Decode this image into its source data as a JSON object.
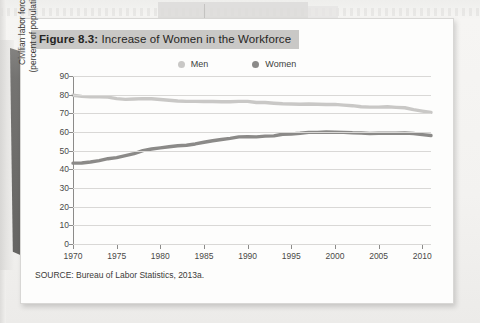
{
  "figure": {
    "number_label": "Figure 8.3:",
    "title": " Increase of Women in the Workforce",
    "source": "SOURCE: Bureau of Labor Statistics, 2013a."
  },
  "colors": {
    "men_line": "#c9c8c6",
    "women_line": "#8b8a88",
    "grid": "#d9d8d6",
    "axis": "#8c8b89",
    "title_band": "#c9c8c6",
    "card": "#fdfdfc",
    "page": "#f2f1ef",
    "binding_shadow": "#6e6d6b"
  },
  "chart_data": {
    "type": "line",
    "title": "Figure 8.3: Increase of Women in the Workforce",
    "xlabel": "",
    "ylabel": "Civilian labor force (percent of population)",
    "ylabel_line1": "Civilian labor force",
    "ylabel_line2": "(percent of population)",
    "xlim": [
      1970,
      2011
    ],
    "ylim": [
      0,
      90
    ],
    "ytick_step": 10,
    "grid": true,
    "legend_position": "top-center",
    "yticks": [
      90,
      80,
      70,
      60,
      50,
      40,
      30,
      20,
      10,
      0
    ],
    "xticks": [
      1970,
      1975,
      1980,
      1985,
      1990,
      1995,
      2000,
      2005,
      2010
    ],
    "x": [
      1970,
      1971,
      1972,
      1973,
      1974,
      1975,
      1976,
      1977,
      1978,
      1979,
      1980,
      1981,
      1982,
      1983,
      1984,
      1985,
      1986,
      1987,
      1988,
      1989,
      1990,
      1991,
      1992,
      1993,
      1994,
      1995,
      1996,
      1997,
      1998,
      1999,
      2000,
      2001,
      2002,
      2003,
      2004,
      2005,
      2006,
      2007,
      2008,
      2009,
      2010,
      2011
    ],
    "series": [
      {
        "name": "Men",
        "color": "#c9c8c6",
        "values": [
          79.7,
          79.1,
          78.9,
          78.8,
          78.7,
          77.9,
          77.5,
          77.7,
          77.9,
          77.8,
          77.4,
          77.0,
          76.6,
          76.4,
          76.4,
          76.3,
          76.3,
          76.2,
          76.2,
          76.4,
          76.4,
          75.8,
          75.8,
          75.4,
          75.1,
          75.0,
          74.9,
          75.0,
          74.9,
          74.7,
          74.8,
          74.4,
          74.1,
          73.5,
          73.3,
          73.3,
          73.5,
          73.2,
          73.0,
          72.0,
          71.2,
          70.5
        ]
      },
      {
        "name": "Women",
        "color": "#8b8a88",
        "values": [
          43.3,
          43.4,
          43.9,
          44.7,
          45.7,
          46.3,
          47.3,
          48.4,
          50.0,
          50.9,
          51.5,
          52.1,
          52.6,
          52.9,
          53.6,
          54.5,
          55.3,
          56.0,
          56.6,
          57.4,
          57.5,
          57.4,
          57.8,
          57.9,
          58.8,
          58.9,
          59.3,
          59.8,
          59.8,
          60.0,
          59.9,
          59.8,
          59.6,
          59.5,
          59.2,
          59.3,
          59.4,
          59.3,
          59.5,
          59.2,
          58.6,
          58.1
        ]
      }
    ]
  }
}
